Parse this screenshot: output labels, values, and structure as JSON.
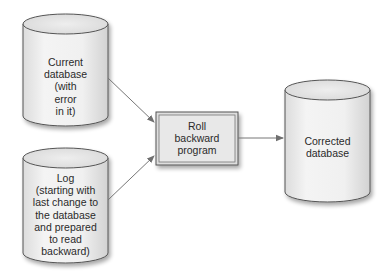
{
  "diagram": {
    "type": "flow",
    "nodes": [
      {
        "id": "current_db",
        "shape": "cylinder",
        "lines": [
          "Current",
          "database",
          "(with",
          "error",
          "in it)"
        ]
      },
      {
        "id": "log",
        "shape": "cylinder",
        "lines": [
          "Log",
          "(starting with",
          "last change to",
          "the database",
          "and prepared",
          "to read",
          "backward)"
        ]
      },
      {
        "id": "roll_backward",
        "shape": "box",
        "lines": [
          "Roll",
          "backward",
          "program"
        ]
      },
      {
        "id": "corrected_db",
        "shape": "cylinder",
        "lines": [
          "Corrected",
          "database"
        ]
      }
    ],
    "edges": [
      {
        "from": "current_db",
        "to": "roll_backward"
      },
      {
        "from": "log",
        "to": "roll_backward"
      },
      {
        "from": "roll_backward",
        "to": "corrected_db"
      }
    ]
  },
  "colors": {
    "background": "#ffffff",
    "shape_fill": "#ededed",
    "shape_top": "#e2e2e2",
    "outline": "#555555",
    "box_fill": "#e4e4e4",
    "arrow": "#777777",
    "text": "#2a2a2a"
  }
}
